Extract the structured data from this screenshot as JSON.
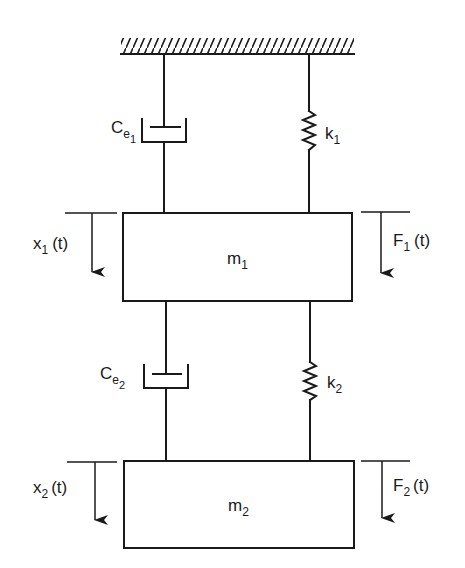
{
  "diagram": {
    "ground": {
      "label": "fixed support"
    },
    "upper_stage": {
      "damper": {
        "symbol": "C",
        "sub": "e",
        "subsub": "1"
      },
      "spring": {
        "symbol": "k",
        "sub": "1"
      }
    },
    "mass1": {
      "symbol": "m",
      "sub": "1"
    },
    "displacement1": {
      "symbol": "x",
      "sub": "1",
      "arg": "(t)"
    },
    "force1": {
      "symbol": "F",
      "sub": "1",
      "arg": "(t)"
    },
    "lower_stage": {
      "damper": {
        "symbol": "C",
        "sub": "e",
        "subsub": "2"
      },
      "spring": {
        "symbol": "k",
        "sub": "2"
      }
    },
    "mass2": {
      "symbol": "m",
      "sub": "2"
    },
    "displacement2": {
      "symbol": "x",
      "sub": "2",
      "arg": "(t)"
    },
    "force2": {
      "symbol": "F",
      "sub": "2",
      "arg": "(t)"
    },
    "colors": {
      "ink": "#1a1a1a",
      "background": "#ffffff"
    }
  }
}
